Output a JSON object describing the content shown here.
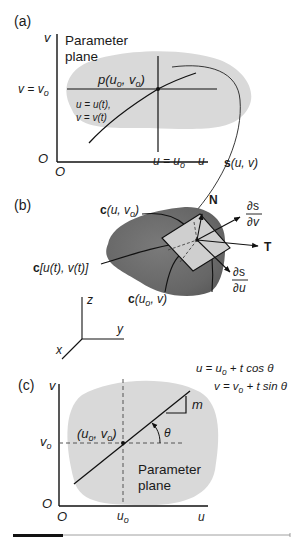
{
  "panel_a": {
    "tag": "(a)",
    "title_line1": "Parameter",
    "title_line2": "plane",
    "axis_v": "v",
    "axis_u": "u",
    "origin_left": "O",
    "origin_bottom": "O",
    "v_eq": "v = v",
    "v_eq_sub": "o",
    "u_eq": "u = u",
    "u_eq_sub": "o",
    "point_label": "p(u",
    "point_sub1": "o",
    "point_mid": ", v",
    "point_sub2": "o",
    "point_close": ")",
    "curve_eq1": "u = u(t),",
    "curve_eq2": "v = v(t)",
    "mapping_label_bold": "s",
    "mapping_label_rest": "(u, v)",
    "fill_color": "#d9d9d9"
  },
  "panel_b": {
    "tag": "(b)",
    "curve_top_bold": "c",
    "curve_top": "(u, v",
    "curve_top_sub": "o",
    "curve_top_close": ")",
    "curve_left_bold": "c",
    "curve_left": "[u(t), v(t)]",
    "curve_bottom_bold": "c",
    "curve_bottom": "(u",
    "curve_bottom_sub": "o",
    "curve_bottom_close": ", v)",
    "normal": "N",
    "tangent": "T",
    "dsdv_num": "∂s",
    "dsdv_den": "∂v",
    "dsdu_num": "∂s",
    "dsdu_den": "∂u",
    "axes": {
      "x": "x",
      "y": "y",
      "z": "z"
    },
    "surface_color": "#6e6e6e",
    "tangent_plane_color": "#cfcfcf"
  },
  "panel_c": {
    "tag": "(c)",
    "axis_v": "v",
    "axis_u": "u",
    "origin_left": "O",
    "origin_bottom": "O",
    "v0": "v",
    "v0_sub": "o",
    "u0": "u",
    "u0_sub": "o",
    "point_label": "(u",
    "point_sub1": "o",
    "point_mid": ", v",
    "point_sub2": "o",
    "point_close": ")",
    "slope": "m",
    "angle": "θ",
    "eq1": "u = u",
    "eq1_sub": "o",
    "eq1_rest": " + t cos θ",
    "eq2": "v = v",
    "eq2_sub": "o",
    "eq2_rest": " + t sin θ",
    "title_line1": "Parameter",
    "title_line2": "plane",
    "fill_color": "#d9d9d9"
  }
}
